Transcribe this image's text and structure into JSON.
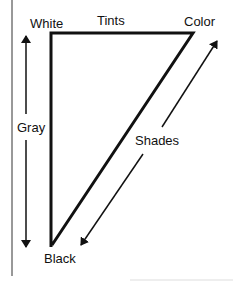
{
  "diagram": {
    "type": "color-triangle",
    "labels": {
      "white": "White",
      "tints": "Tints",
      "color": "Color",
      "gray": "Gray",
      "shades": "Shades",
      "black": "Black"
    },
    "vertices": {
      "white": [
        51,
        33
      ],
      "color": [
        193,
        33
      ],
      "black": [
        52,
        245
      ]
    },
    "arrows": {
      "gray": {
        "from": [
          26,
          248
        ],
        "to": [
          26,
          35
        ],
        "bidirectional": true
      },
      "shades": {
        "from": [
          80,
          246
        ],
        "to": [
          218,
          40
        ],
        "bidirectional": true
      }
    },
    "colors": {
      "stroke": "#111111",
      "background": "#ffffff"
    }
  }
}
